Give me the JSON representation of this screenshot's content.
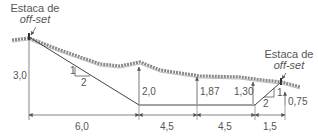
{
  "labels": {
    "stake_left_line1": "Estaca de",
    "stake_left_line2": "off-set",
    "stake_right_line1": "Estaca de",
    "stake_right_line2": "off-set"
  },
  "heights": {
    "left": "3,0",
    "mid1": "2,0",
    "mid2": "1,87",
    "mid3": "1,30",
    "right": "0,75"
  },
  "widths": {
    "w1": "6,0",
    "w2": "4,5",
    "w3": "4,5",
    "w4": "1,5"
  },
  "slopes": {
    "left_rise": "1",
    "left_run": "2",
    "right_rise": "1",
    "right_run": "2"
  },
  "colors": {
    "line": "#555555",
    "ground": "#8a8a8a"
  }
}
